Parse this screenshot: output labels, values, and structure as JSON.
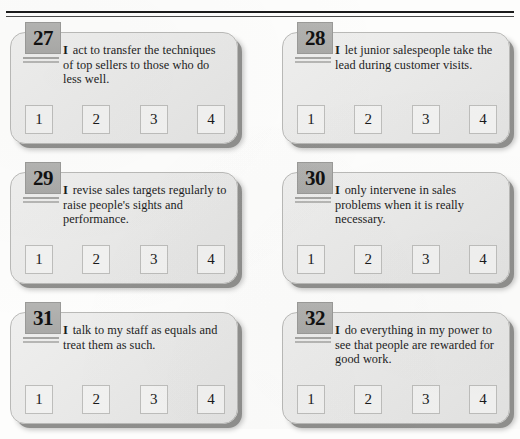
{
  "page": {
    "top_rule": "double-horizontal-rule"
  },
  "scale": {
    "options": [
      "1",
      "2",
      "3",
      "4"
    ]
  },
  "items": [
    {
      "number": "27",
      "lead": "I",
      "text": " act to transfer the techniques of top sellers to those who do less well.",
      "options": [
        "1",
        "2",
        "3",
        "4"
      ]
    },
    {
      "number": "28",
      "lead": "I",
      "text": " let junior salespeople take the lead during customer visits.",
      "options": [
        "1",
        "2",
        "3",
        "4"
      ]
    },
    {
      "number": "29",
      "lead": "I",
      "text": " revise sales targets regularly to raise people's sights and performance.",
      "options": [
        "1",
        "2",
        "3",
        "4"
      ]
    },
    {
      "number": "30",
      "lead": "I",
      "text": " only intervene in sales problems when it is really necessary.",
      "options": [
        "1",
        "2",
        "3",
        "4"
      ]
    },
    {
      "number": "31",
      "lead": "I",
      "text": " talk to my staff as equals and treat them as such.",
      "options": [
        "1",
        "2",
        "3",
        "4"
      ]
    },
    {
      "number": "32",
      "lead": "I",
      "text": " do everything in my power to see that people are rewarded for good work.",
      "options": [
        "1",
        "2",
        "3",
        "4"
      ]
    }
  ]
}
